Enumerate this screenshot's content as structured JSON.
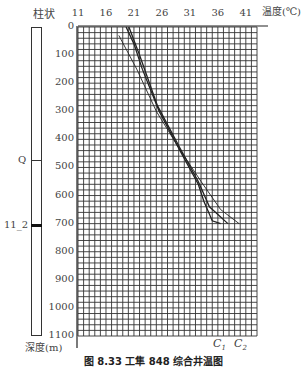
{
  "chart_data": {
    "type": "line",
    "title": "",
    "caption": "图 8.33 工隼 848 综合井温图",
    "xlabel": "温度(℃)",
    "ylabel": "深度(m)",
    "xlim": [
      11,
      43
    ],
    "ylim": [
      1100,
      0
    ],
    "x_ticks": [
      "11",
      "16",
      "21",
      "26",
      "31",
      "36",
      "41"
    ],
    "y_ticks": [
      "0",
      "100",
      "200",
      "300",
      "400",
      "500",
      "600",
      "700",
      "800",
      "900",
      "1000",
      "1100"
    ],
    "grid": true,
    "legend": "curve labels at bottom",
    "column_title": "柱状",
    "strata": [
      {
        "label": "Q",
        "depth": 480
      },
      {
        "label": "11_2",
        "depth": 700
      }
    ],
    "series": [
      {
        "name": "C1",
        "points": [
          [
            19.6,
            0
          ],
          [
            21.0,
            60
          ],
          [
            22.5,
            150
          ],
          [
            25.5,
            300
          ],
          [
            29.5,
            450
          ],
          [
            32.5,
            560
          ],
          [
            33.5,
            620
          ],
          [
            35.0,
            690
          ],
          [
            36.5,
            700
          ]
        ]
      },
      {
        "name": "C1b",
        "points": [
          [
            20.1,
            0
          ],
          [
            22.0,
            100
          ],
          [
            25.2,
            280
          ],
          [
            29.2,
            430
          ],
          [
            32.5,
            550
          ],
          [
            34.5,
            640
          ],
          [
            37.8,
            700
          ]
        ]
      },
      {
        "name": "C2",
        "points": [
          [
            18.3,
            30
          ],
          [
            21.5,
            150
          ],
          [
            25.0,
            300
          ],
          [
            29.0,
            430
          ],
          [
            33.0,
            550
          ],
          [
            36.5,
            650
          ],
          [
            39.8,
            700
          ]
        ]
      }
    ],
    "curve_labels": [
      "C1",
      "C2"
    ]
  },
  "labels": {
    "column_title": "柱状",
    "x_axis": "温度(℃)",
    "y_axis": "深度(m)",
    "strat_q": "Q",
    "strat_11": "11_2",
    "c1": "C",
    "c1_sub": "1",
    "c2": "C",
    "c2_sub": "2",
    "caption": "图 8.33 工隼 848 综合井温图"
  }
}
